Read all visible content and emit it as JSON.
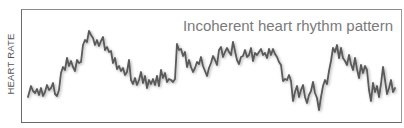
{
  "chart_data": {
    "type": "line",
    "title": "Incoherent heart rhythm pattern",
    "xlabel": "",
    "ylabel": "HEART RATE",
    "grid": false,
    "legend": null,
    "axis_ticks": false,
    "line_color": "#5a5a5a",
    "series": [
      {
        "name": "Heart rate",
        "points_px": [
          [
            28,
            97
          ],
          [
            31,
            86
          ],
          [
            33,
            91
          ],
          [
            35,
            93
          ],
          [
            37,
            89
          ],
          [
            39,
            95
          ],
          [
            41,
            88
          ],
          [
            43,
            96
          ],
          [
            45,
            92
          ],
          [
            47,
            85
          ],
          [
            49,
            90
          ],
          [
            51,
            88
          ],
          [
            53,
            83
          ],
          [
            55,
            94
          ],
          [
            57,
            96
          ],
          [
            59,
            90
          ],
          [
            61,
            73
          ],
          [
            63,
            67
          ],
          [
            65,
            70
          ],
          [
            67,
            58
          ],
          [
            69,
            66
          ],
          [
            71,
            61
          ],
          [
            73,
            67
          ],
          [
            75,
            71
          ],
          [
            77,
            60
          ],
          [
            79,
            63
          ],
          [
            81,
            62
          ],
          [
            83,
            45
          ],
          [
            85,
            40
          ],
          [
            87,
            42
          ],
          [
            89,
            31
          ],
          [
            91,
            35
          ],
          [
            93,
            38
          ],
          [
            95,
            45
          ],
          [
            97,
            40
          ],
          [
            99,
            46
          ],
          [
            101,
            41
          ],
          [
            103,
            37
          ],
          [
            105,
            50
          ],
          [
            107,
            47
          ],
          [
            109,
            52
          ],
          [
            111,
            51
          ],
          [
            113,
            63
          ],
          [
            115,
            58
          ],
          [
            117,
            69
          ],
          [
            119,
            66
          ],
          [
            121,
            71
          ],
          [
            123,
            68
          ],
          [
            125,
            75
          ],
          [
            127,
            72
          ],
          [
            129,
            60
          ],
          [
            131,
            80
          ],
          [
            133,
            84
          ],
          [
            135,
            78
          ],
          [
            137,
            85
          ],
          [
            139,
            80
          ],
          [
            141,
            72
          ],
          [
            143,
            83
          ],
          [
            145,
            76
          ],
          [
            147,
            88
          ],
          [
            149,
            80
          ],
          [
            151,
            84
          ],
          [
            153,
            79
          ],
          [
            155,
            85
          ],
          [
            157,
            76
          ],
          [
            159,
            86
          ],
          [
            161,
            70
          ],
          [
            163,
            78
          ],
          [
            165,
            73
          ],
          [
            167,
            82
          ],
          [
            169,
            79
          ],
          [
            171,
            80
          ],
          [
            173,
            82
          ],
          [
            175,
            79
          ],
          [
            177,
            44
          ],
          [
            179,
            50
          ],
          [
            181,
            49
          ],
          [
            183,
            56
          ],
          [
            185,
            52
          ],
          [
            187,
            67
          ],
          [
            189,
            60
          ],
          [
            191,
            67
          ],
          [
            193,
            72
          ],
          [
            195,
            68
          ],
          [
            197,
            62
          ],
          [
            199,
            64
          ],
          [
            201,
            57
          ],
          [
            203,
            66
          ],
          [
            205,
            71
          ],
          [
            207,
            76
          ],
          [
            209,
            68
          ],
          [
            211,
            63
          ],
          [
            213,
            56
          ],
          [
            215,
            60
          ],
          [
            217,
            65
          ],
          [
            219,
            50
          ],
          [
            221,
            47
          ],
          [
            223,
            57
          ],
          [
            225,
            52
          ],
          [
            227,
            48
          ],
          [
            229,
            52
          ],
          [
            231,
            55
          ],
          [
            233,
            42
          ],
          [
            235,
            51
          ],
          [
            237,
            60
          ],
          [
            239,
            64
          ],
          [
            241,
            57
          ],
          [
            243,
            56
          ],
          [
            245,
            50
          ],
          [
            247,
            57
          ],
          [
            249,
            55
          ],
          [
            251,
            48
          ],
          [
            253,
            61
          ],
          [
            255,
            53
          ],
          [
            257,
            55
          ],
          [
            259,
            52
          ],
          [
            261,
            49
          ],
          [
            263,
            55
          ],
          [
            265,
            53
          ],
          [
            267,
            58
          ],
          [
            269,
            49
          ],
          [
            271,
            55
          ],
          [
            273,
            49
          ],
          [
            275,
            54
          ],
          [
            277,
            57
          ],
          [
            279,
            62
          ],
          [
            281,
            65
          ],
          [
            283,
            81
          ],
          [
            285,
            79
          ],
          [
            287,
            80
          ],
          [
            289,
            75
          ],
          [
            291,
            81
          ],
          [
            293,
            101
          ],
          [
            295,
            92
          ],
          [
            297,
            86
          ],
          [
            299,
            97
          ],
          [
            301,
            90
          ],
          [
            303,
            85
          ],
          [
            305,
            97
          ],
          [
            307,
            103
          ],
          [
            309,
            95
          ],
          [
            311,
            91
          ],
          [
            313,
            82
          ],
          [
            315,
            93
          ],
          [
            317,
            98
          ],
          [
            319,
            110
          ],
          [
            321,
            97
          ],
          [
            323,
            86
          ],
          [
            325,
            80
          ],
          [
            327,
            84
          ],
          [
            329,
            71
          ],
          [
            331,
            61
          ],
          [
            333,
            48
          ],
          [
            335,
            52
          ],
          [
            337,
            45
          ],
          [
            339,
            58
          ],
          [
            341,
            48
          ],
          [
            343,
            58
          ],
          [
            345,
            61
          ],
          [
            347,
            65
          ],
          [
            349,
            55
          ],
          [
            351,
            64
          ],
          [
            353,
            70
          ],
          [
            355,
            58
          ],
          [
            357,
            69
          ],
          [
            359,
            78
          ],
          [
            361,
            65
          ],
          [
            363,
            73
          ],
          [
            365,
            66
          ],
          [
            367,
            70
          ],
          [
            369,
            90
          ],
          [
            371,
            101
          ],
          [
            373,
            83
          ],
          [
            375,
            92
          ],
          [
            377,
            86
          ],
          [
            379,
            97
          ],
          [
            381,
            84
          ],
          [
            383,
            67
          ],
          [
            385,
            80
          ],
          [
            387,
            94
          ],
          [
            389,
            88
          ],
          [
            391,
            80
          ],
          [
            393,
            92
          ],
          [
            395,
            88
          ]
        ]
      }
    ],
    "plot_area_px": {
      "left": 21,
      "top": 9,
      "right": 402,
      "bottom": 123
    }
  }
}
